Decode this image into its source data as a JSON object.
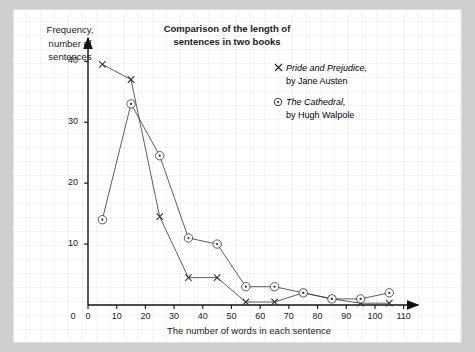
{
  "chart_data": {
    "type": "line",
    "title": "Comparison of the length of\nsentences in two books",
    "xlabel": "The number of words in each sentence",
    "ylabel": "Frequency,\nnumber of\nsentences",
    "xlim": [
      0,
      115
    ],
    "ylim": [
      0,
      43
    ],
    "xticks": [
      0,
      10,
      20,
      30,
      40,
      50,
      60,
      70,
      80,
      90,
      100,
      110
    ],
    "yticks": [
      10,
      20,
      30,
      40
    ],
    "grid": true,
    "legend_position": "top-right",
    "x": [
      5,
      15,
      25,
      35,
      45,
      55,
      65,
      75,
      85,
      95,
      105
    ],
    "series": [
      {
        "name": "Pride and Prejudice,",
        "author": "by Jane Austen",
        "marker": "x",
        "color": "#333333",
        "values": [
          39.5,
          37,
          14.5,
          4.5,
          4.5,
          0.5,
          0.5,
          2,
          1,
          0.3,
          0.3
        ]
      },
      {
        "name": "The Cathedral,",
        "author": "by Hugh Walpole",
        "marker": "circle-dot",
        "color": "#333333",
        "values": [
          14,
          33,
          24.5,
          11,
          10,
          3,
          3,
          2,
          1,
          1,
          2
        ]
      }
    ]
  },
  "legend": {
    "items": [
      {
        "marker": "x-marker-icon",
        "title": "Pride and Prejudice,",
        "subtitle": "by Jane Austen"
      },
      {
        "marker": "circle-dot-marker-icon",
        "title": "The Cathedral,",
        "subtitle": "by Hugh Walpole"
      }
    ]
  }
}
